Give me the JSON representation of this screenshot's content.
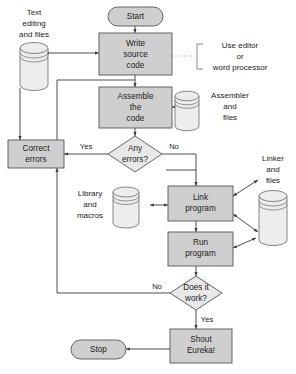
{
  "diagram": {
    "colors": {
      "process_fill": "#cfcfcf",
      "decision_fill": "#e8e8e8",
      "store_fill": "#ededed",
      "stroke": "#555555",
      "line": "#3a3a3a",
      "dotted": "#9a9a9a",
      "text": "#1b1b1b"
    },
    "nodes": {
      "start": {
        "label": "Start",
        "type": "terminator"
      },
      "write_source": {
        "type": "process",
        "lines": [
          "Write",
          "source",
          "code"
        ]
      },
      "assemble": {
        "type": "process",
        "lines": [
          "Assemble",
          "the",
          "code"
        ]
      },
      "any_errors": {
        "type": "decision",
        "lines": [
          "Any",
          "errors?"
        ]
      },
      "correct_errors": {
        "type": "process",
        "lines": [
          "Correct",
          "errors"
        ]
      },
      "link_program": {
        "type": "process",
        "lines": [
          "Link",
          "program"
        ]
      },
      "run_program": {
        "type": "process",
        "lines": [
          "Run",
          "program"
        ]
      },
      "does_it_work": {
        "type": "decision",
        "lines": [
          "Does it",
          "work?"
        ]
      },
      "shout_eureka": {
        "type": "process",
        "lines": [
          "Shout",
          "Eureka!"
        ]
      },
      "stop": {
        "label": "Stop",
        "type": "terminator"
      }
    },
    "stores": {
      "text_editing": {
        "type": "data-store",
        "lines": [
          "Text",
          "editing",
          "and files"
        ]
      },
      "assembler": {
        "type": "data-store",
        "lines": [
          "Assembler",
          "and",
          "files"
        ]
      },
      "library": {
        "type": "data-store",
        "lines": [
          "Library",
          "and",
          "macros"
        ]
      },
      "linker": {
        "type": "data-store",
        "lines": [
          "Linker",
          "and",
          "files"
        ]
      }
    },
    "edge_labels": {
      "errors_yes": "Yes",
      "errors_no": "No",
      "work_no": "No",
      "work_yes": "Yes"
    },
    "annotations": {
      "editor_note": {
        "lines": [
          "Use editor",
          "or",
          "word processor"
        ]
      }
    }
  }
}
